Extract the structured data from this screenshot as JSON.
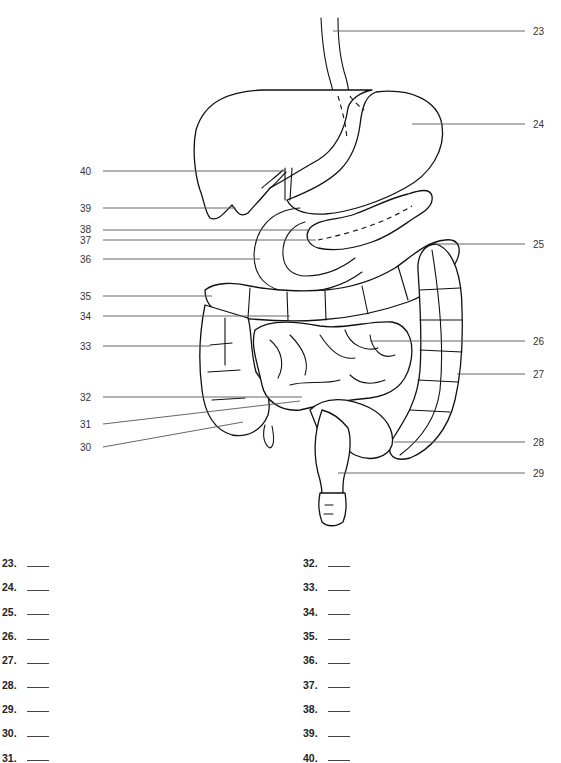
{
  "diagram": {
    "callouts_right": [
      {
        "number": "23",
        "y": 31,
        "target": "esophagus"
      },
      {
        "number": "24",
        "y": 124,
        "target": "stomach"
      },
      {
        "number": "25",
        "y": 244,
        "target": "transverse colon (left flexure)"
      },
      {
        "number": "26",
        "y": 341,
        "target": "small intestine"
      },
      {
        "number": "27",
        "y": 374,
        "target": "descending colon"
      },
      {
        "number": "28",
        "y": 442,
        "target": "sigmoid colon"
      },
      {
        "number": "29",
        "y": 473,
        "target": "rectum"
      }
    ],
    "callouts_left": [
      {
        "number": "40",
        "y": 171,
        "target": "liver"
      },
      {
        "number": "39",
        "y": 208,
        "target": "gallbladder"
      },
      {
        "number": "38",
        "y": 230,
        "target": "pancreas"
      },
      {
        "number": "37",
        "y": 240,
        "target": "pancreatic duct"
      },
      {
        "number": "36",
        "y": 259,
        "target": "duodenum"
      },
      {
        "number": "35",
        "y": 296,
        "target": "hepatic flexure"
      },
      {
        "number": "34",
        "y": 316,
        "target": "transverse colon"
      },
      {
        "number": "33",
        "y": 346,
        "target": "ascending colon"
      },
      {
        "number": "32",
        "y": 397,
        "target": "ileum"
      },
      {
        "number": "31",
        "y": 424,
        "target": "cecum"
      },
      {
        "number": "30",
        "y": 447,
        "target": "appendix"
      }
    ]
  },
  "answers": {
    "left_column": [
      {
        "label": "23.",
        "value": ""
      },
      {
        "label": "24.",
        "value": ""
      },
      {
        "label": "25.",
        "value": ""
      },
      {
        "label": "26.",
        "value": ""
      },
      {
        "label": "27.",
        "value": ""
      },
      {
        "label": "28.",
        "value": ""
      },
      {
        "label": "29.",
        "value": ""
      },
      {
        "label": "30.",
        "value": ""
      },
      {
        "label": "31.",
        "value": ""
      }
    ],
    "right_column": [
      {
        "label": "32.",
        "value": ""
      },
      {
        "label": "33.",
        "value": ""
      },
      {
        "label": "34.",
        "value": ""
      },
      {
        "label": "35.",
        "value": ""
      },
      {
        "label": "36.",
        "value": ""
      },
      {
        "label": "37.",
        "value": ""
      },
      {
        "label": "38.",
        "value": ""
      },
      {
        "label": "39.",
        "value": ""
      },
      {
        "label": "40.",
        "value": ""
      }
    ]
  }
}
